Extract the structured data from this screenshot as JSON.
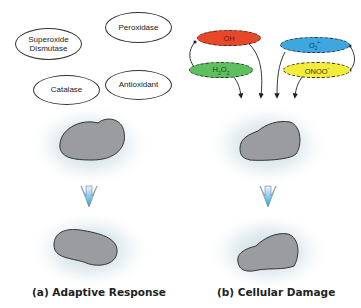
{
  "panel_a": {
    "enzymes": [
      {
        "label": "Superoxide Dismutase",
        "line1": "Superoxide",
        "line2": "Dismutase"
      },
      {
        "label": "Peroxidase"
      },
      {
        "label": "Catalase"
      },
      {
        "label": "Antioxidant"
      }
    ],
    "caption": "(a) Adaptive Response"
  },
  "panel_b": {
    "species": [
      {
        "label": "OH",
        "sup": "",
        "color": "#e8472a"
      },
      {
        "label": "H2O2",
        "base": "H",
        "sub1": "2",
        "mid": "O",
        "sub2": "2",
        "color": "#5dbf5e"
      },
      {
        "label": "O2•-",
        "base": "O",
        "sub1": "2",
        "sup": "•-",
        "color": "#3fa7e0"
      },
      {
        "label": "ONOO-",
        "base": "ONOO",
        "sup": "-",
        "color": "#f3ec3a"
      }
    ],
    "caption": "(b) Cellular Damage"
  },
  "colors": {
    "cell_fill": "#9a9c9f",
    "cell_stroke": "#333333",
    "arrow_top": "#d9eef9",
    "arrow_bottom": "#3aa6e0"
  }
}
